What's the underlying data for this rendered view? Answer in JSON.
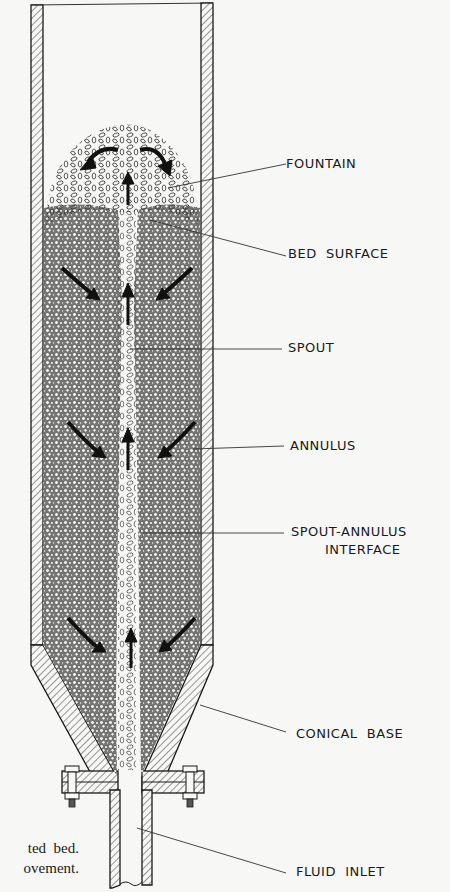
{
  "diagram": {
    "labels": {
      "fountain": "FOUNTAIN",
      "bed_surface": "BED  SURFACE",
      "spout": "SPOUT",
      "annulus": "ANNULUS",
      "interface_line1": "SPOUT-ANNULUS",
      "interface_line2": "INTERFACE",
      "conical_base": "CONICAL  BASE",
      "fluid_inlet": "FLUID  INLET"
    },
    "caption_fragment": {
      "line1": "ted  bed.",
      "line2": "ovement."
    },
    "colors": {
      "ink": "#1a1a1a",
      "paper": "#f7f7f5",
      "bed_fill": "#8a8a88"
    }
  }
}
